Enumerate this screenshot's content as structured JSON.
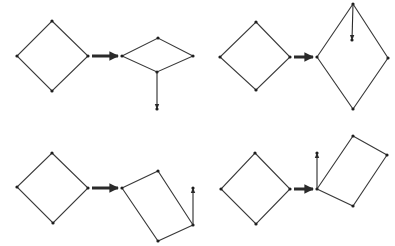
{
  "figure": {
    "colors": {
      "line": "#3a3a3a",
      "vertex": "#1e1e1e",
      "background": "#ffffff"
    },
    "panels": [
      {
        "id": "top-left",
        "source": [
          [
            52,
            21
          ],
          [
            88,
            56
          ],
          [
            52,
            91
          ],
          [
            17,
            56
          ]
        ],
        "transition_arrow": [
          [
            92,
            56
          ],
          [
            118,
            56
          ]
        ],
        "target": [
          [
            122,
            56
          ],
          [
            158,
            38
          ],
          [
            193,
            56
          ],
          [
            157,
            72
          ]
        ],
        "vector": [
          [
            157,
            72
          ],
          [
            157,
            109
          ]
        ]
      },
      {
        "id": "top-right",
        "source": [
          [
            256,
            22
          ],
          [
            290,
            57
          ],
          [
            256,
            90
          ],
          [
            220,
            57
          ]
        ],
        "transition_arrow": [
          [
            294,
            57
          ],
          [
            313,
            57
          ]
        ],
        "target": [
          [
            317,
            57
          ],
          [
            353,
            4
          ],
          [
            388,
            58
          ],
          [
            353,
            109
          ]
        ],
        "vector": [
          [
            353,
            4
          ],
          [
            352,
            40
          ]
        ]
      },
      {
        "id": "bottom-left",
        "source": [
          [
            52,
            153
          ],
          [
            88,
            188
          ],
          [
            53,
            223
          ],
          [
            17,
            187
          ]
        ],
        "transition_arrow": [
          [
            92,
            188
          ],
          [
            118,
            188
          ]
        ],
        "target": [
          [
            122,
            188
          ],
          [
            158,
            171
          ],
          [
            193,
            225
          ],
          [
            158,
            241
          ]
        ],
        "vector": [
          [
            193,
            225
          ],
          [
            193,
            188
          ]
        ]
      },
      {
        "id": "bottom-right",
        "source": [
          [
            255,
            153
          ],
          [
            290,
            189
          ],
          [
            256,
            224
          ],
          [
            221,
            189
          ]
        ],
        "transition_arrow": [
          [
            294,
            189
          ],
          [
            313,
            189
          ]
        ],
        "target": [
          [
            317,
            189
          ],
          [
            353,
            136
          ],
          [
            387,
            155
          ],
          [
            353,
            206
          ]
        ],
        "vector": [
          [
            317,
            189
          ],
          [
            317,
            153
          ]
        ]
      }
    ]
  }
}
